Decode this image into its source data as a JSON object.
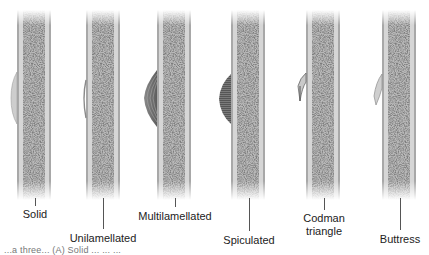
{
  "figure": {
    "colors": {
      "cortex": "#cfcfcf",
      "cortex_edge": "#9a9a9a",
      "marrow_dark": "#3a3a3a",
      "marrow_light": "#bdbdbd",
      "reaction_light": "#c8c8c8",
      "reaction_dark": "#6e6e6e",
      "label_text": "#222222"
    },
    "panels": [
      {
        "id": "solid",
        "label": "Solid",
        "bone_x": 17,
        "label_x": 35,
        "label_y": 208,
        "leader_top": 197,
        "leader_bottom": 205
      },
      {
        "id": "unilamellated",
        "label": "Unilamellated",
        "bone_x": 86,
        "label_x": 103,
        "label_y": 232,
        "leader_top": 197,
        "leader_bottom": 229
      },
      {
        "id": "multilamellated",
        "label": "Multilamellated",
        "bone_x": 157,
        "label_x": 175,
        "label_y": 210,
        "leader_top": 197,
        "leader_bottom": 207
      },
      {
        "id": "spiculated",
        "label": "Spiculated",
        "bone_x": 231,
        "label_x": 249,
        "label_y": 234,
        "leader_top": 197,
        "leader_bottom": 231
      },
      {
        "id": "codman",
        "label_lines": [
          "Codman",
          "triangle"
        ],
        "bone_x": 306,
        "label_x": 324,
        "label_y": 213,
        "leader_top": 197,
        "leader_bottom": 210
      },
      {
        "id": "buttress",
        "label": "Buttress",
        "bone_x": 382,
        "label_x": 400,
        "label_y": 233,
        "leader_top": 197,
        "leader_bottom": 230
      }
    ],
    "caption_fragment": "...a three... (A) Solid ... ... ..."
  }
}
